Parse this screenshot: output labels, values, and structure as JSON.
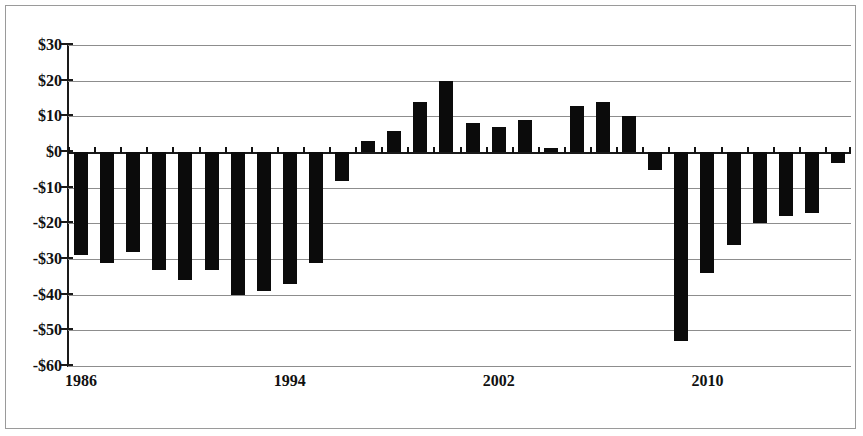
{
  "chart_data": {
    "type": "bar",
    "title": "",
    "subtitle": "",
    "xlabel": "",
    "ylabel": "",
    "ylim": [
      -60,
      30
    ],
    "ytick_labels": [
      "$30",
      "$20",
      "$10",
      "$0",
      "-$10",
      "-$20",
      "-$30",
      "-$40",
      "-$50",
      "-$60"
    ],
    "ytick_values": [
      30,
      20,
      10,
      0,
      -10,
      -20,
      -30,
      -40,
      -50,
      -60
    ],
    "xtick_labels": [
      "1986",
      "1994",
      "2002",
      "2010"
    ],
    "xtick_values": [
      1986,
      1994,
      2002,
      2010
    ],
    "grid": true,
    "legend": false,
    "bar_color": "#0b0b0b",
    "categories": [
      "1986",
      "1987",
      "1988",
      "1989",
      "1990",
      "1991",
      "1992",
      "1993",
      "1994",
      "1995",
      "1996",
      "1997",
      "1998",
      "1999",
      "2000",
      "2001",
      "2002",
      "2003",
      "2004",
      "2005",
      "2006",
      "2007",
      "2008",
      "2009",
      "2010",
      "2011",
      "2012",
      "2013",
      "2014",
      "2015"
    ],
    "values": [
      -29,
      -31,
      -28,
      -33,
      -36,
      -33,
      -40,
      -39,
      -37,
      -31,
      -8,
      3,
      6,
      14,
      20,
      8,
      7,
      9,
      1,
      13,
      14,
      10,
      -5,
      -53,
      -34,
      -26,
      -20,
      -18,
      -17,
      -3
    ]
  },
  "axis": {
    "y_ticks": [
      {
        "label": "$30",
        "value": 30
      },
      {
        "label": "$20",
        "value": 20
      },
      {
        "label": "$10",
        "value": 10
      },
      {
        "label": "$0",
        "value": 0
      },
      {
        "label": "-$10",
        "value": -10
      },
      {
        "label": "-$20",
        "value": -20
      },
      {
        "label": "-$30",
        "value": -30
      },
      {
        "label": "-$40",
        "value": -40
      },
      {
        "label": "-$50",
        "value": -50
      },
      {
        "label": "-$60",
        "value": -60
      }
    ],
    "x_ticks": [
      {
        "label": "1986",
        "value": 1986
      },
      {
        "label": "1994",
        "value": 1994
      },
      {
        "label": "2002",
        "value": 2002
      },
      {
        "label": "2010",
        "value": 2010
      }
    ]
  }
}
